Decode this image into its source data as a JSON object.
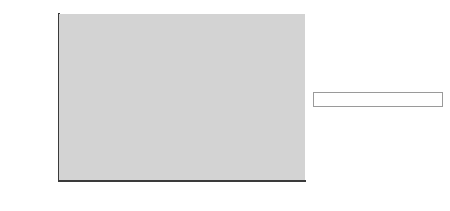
{
  "chart_data": {
    "type": "bar",
    "subtype": "stacked-bar",
    "title": "",
    "xlabel": "",
    "ylabel": "",
    "categories": [
      "1998",
      "1999",
      "2000",
      "2001",
      "2002",
      "2003"
    ],
    "series": [
      {
        "name": "Total North American ad spending*",
        "color": "#8e8e8e",
        "values": [
          1300,
          2340,
          3995,
          5425,
          7890,
          10680
        ],
        "labels": [
          "$1,300",
          "$2,340",
          "$3,995",
          "$5,425",
          "$7,890",
          "$10,680"
        ]
      },
      {
        "name": "Barter, revenue sharing, intra-industry spending",
        "color": "#1c1c1c",
        "values": [
          360,
          580,
          825,
          905,
          1080,
          935
        ],
        "labels": [
          "$360",
          "$580",
          "$825",
          "$905",
          "$1,080",
          "$935"
        ]
      }
    ],
    "totals": [
      1660,
      2920,
      4820,
      6330,
      8970,
      11615
    ],
    "ylim": [
      0,
      14000
    ],
    "ytick_values": [
      0,
      2000,
      4000,
      6000,
      8000,
      10000,
      12000,
      14000
    ],
    "ytick_labels": [
      "$0",
      "$2,000",
      "$4,000",
      "$6,000",
      "$8,000",
      "$10,000",
      "$12,000",
      "$14,000"
    ],
    "grid": false,
    "legend_position": "right",
    "plot_background": "#d3d3d3"
  },
  "legend": {
    "entries": [
      {
        "label": "Barter, revenue sharing, intra-industry spending",
        "swatch": "dark"
      },
      {
        "label": "Total North American ad spending*",
        "swatch": "light"
      }
    ]
  }
}
